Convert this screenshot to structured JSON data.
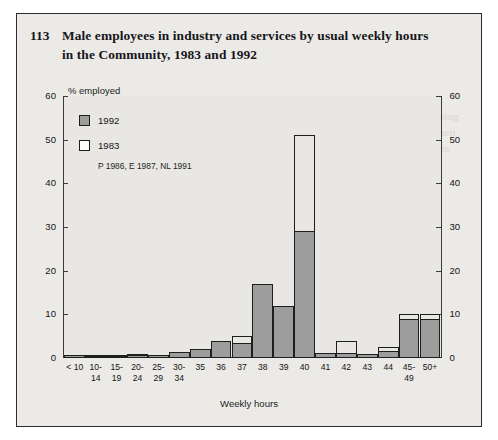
{
  "figure": {
    "number": "113",
    "title": "Male employees in industry and services by usual weekly hours in the Community, 1983 and 1992"
  },
  "legend": {
    "position": "top-left-inside-plot",
    "items": [
      {
        "label": "1992",
        "style": "filled-gray",
        "color": "#9d9d9d"
      },
      {
        "label": "1983",
        "style": "hollow-outline",
        "color": "#ffffff"
      }
    ],
    "note": "P 1986, E 1987, NL 1991"
  },
  "axes": {
    "y_caption": "% employed",
    "x_caption": "Weekly hours",
    "y_ticks": [
      "0",
      "10",
      "20",
      "30",
      "40",
      "50",
      "60"
    ],
    "y_ticks_right": [
      "0",
      "10",
      "20",
      "30",
      "40",
      "50",
      "60"
    ]
  },
  "chart_data": {
    "type": "bar",
    "title": "Male employees in industry and services by usual weekly hours in the Community, 1983 and 1992",
    "xlabel": "Weekly hours",
    "ylabel": "% employed",
    "ylim": [
      0,
      60
    ],
    "yticks": [
      0,
      10,
      20,
      30,
      40,
      50,
      60
    ],
    "grid": false,
    "legend_position": "upper left",
    "annotations": [
      "P 1986, E 1987, NL 1991"
    ],
    "categories": [
      "< 10",
      "10-\n14",
      "15-\n19",
      "20-\n24",
      "25-\n29",
      "30-\n34",
      "35",
      "36",
      "37",
      "38",
      "39",
      "40",
      "41",
      "42",
      "43",
      "44",
      "45-\n49",
      "50+"
    ],
    "series": [
      {
        "name": "1992",
        "color": "#9d9d9d",
        "values": [
          0.6,
          0.5,
          0.5,
          0.8,
          0.7,
          1.3,
          2.0,
          3.8,
          3.5,
          17.0,
          12.0,
          29.0,
          1.2,
          1.1,
          1.0,
          1.6,
          9.0,
          9.0
        ]
      },
      {
        "name": "1983",
        "color": "#ffffff",
        "values": [
          0.7,
          0.6,
          0.6,
          0.9,
          0.8,
          1.1,
          1.6,
          2.6,
          5.0,
          6.8,
          10.2,
          51.0,
          1.1,
          4.0,
          1.0,
          2.6,
          10.0,
          10.0
        ]
      }
    ]
  }
}
